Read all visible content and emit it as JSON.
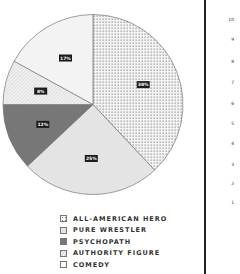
{
  "chart_data": {
    "type": "pie",
    "title": "",
    "categories": [
      "ALL-AMERICAN HERO",
      "PURE WRESTLER",
      "PSYCHOPATH",
      "AUTHORITY FIGURE",
      "COMEDY"
    ],
    "values": [
      38,
      25,
      12,
      8,
      17
    ],
    "labels": [
      "38%",
      "25%",
      "12%",
      "8%",
      "17%"
    ],
    "fills": [
      "dotted",
      "#e4e4e4",
      "#777777",
      "hatched",
      "#f3f3f3"
    ],
    "start_angle": "12 o'clock",
    "direction": "clockwise",
    "legend_position": "bottom"
  },
  "legend": {
    "items": [
      {
        "label": "ALL-AMERICAN HERO"
      },
      {
        "label": "PURE WRESTLER"
      },
      {
        "label": "PSYCHOPATH"
      },
      {
        "label": "AUTHORITY FIGURE"
      },
      {
        "label": "COMEDY"
      }
    ]
  },
  "right_axis": {
    "ticks": [
      "10",
      "9",
      "8",
      "7",
      "6",
      "5",
      "4",
      "3",
      "2",
      "1"
    ]
  },
  "colors": {
    "outline": "#777777",
    "label_bg": "#1a1a1a",
    "divider": "#222222"
  }
}
